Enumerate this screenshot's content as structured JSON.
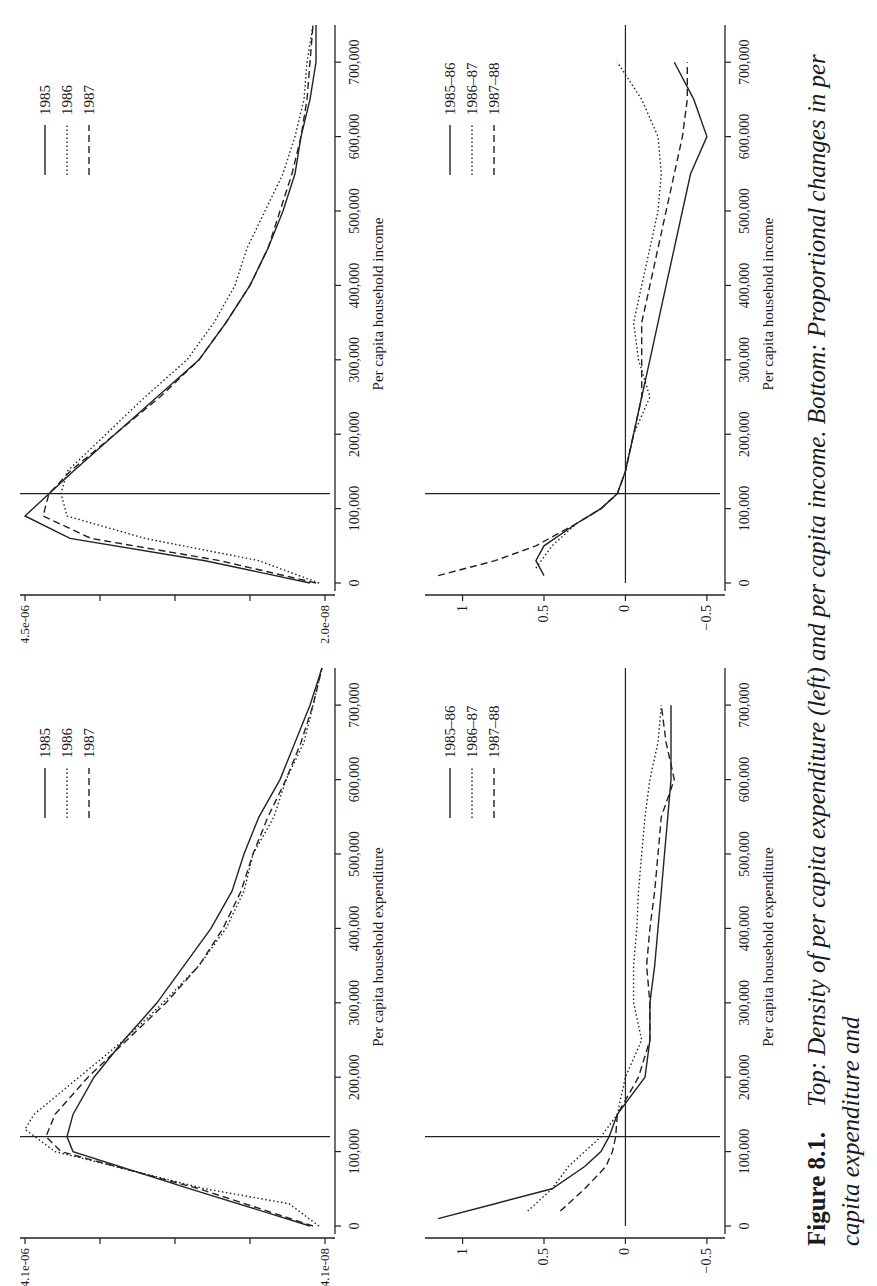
{
  "caption": {
    "figure_label": "Figure 8.1.",
    "text": "Top: Density of per capita expenditure (left) and per capita income. Bottom: Proportional changes in per capita expenditure and"
  },
  "chart_data": [
    {
      "id": "top-left",
      "type": "line",
      "title": "",
      "xlabel": "Per capita household expenditure",
      "ylabel": "",
      "x_ticks": [
        "0",
        "100,000",
        "200,000",
        "300,000",
        "400,000",
        "500,000",
        "600,000",
        "700,000"
      ],
      "y_tick_labels": [
        "4.1e-08",
        "4.1e-06"
      ],
      "y_scale": "log",
      "ylim": [
        4.1e-08,
        4.1e-06
      ],
      "xlim": [
        0,
        750000
      ],
      "vertical_reference_line_x": 120000,
      "legend": [
        "1985",
        "1986",
        "1987"
      ],
      "legend_position": "upper right",
      "series": [
        {
          "name": "1985",
          "style": "solid",
          "x": [
            0,
            50000,
            100000,
            120000,
            150000,
            200000,
            250000,
            300000,
            350000,
            400000,
            450000,
            500000,
            550000,
            600000,
            650000,
            700000,
            750000
          ],
          "y_rel": [
            0.05,
            0.45,
            0.84,
            0.86,
            0.84,
            0.77,
            0.67,
            0.56,
            0.47,
            0.38,
            0.31,
            0.27,
            0.22,
            0.15,
            0.1,
            0.05,
            0.01
          ]
        },
        {
          "name": "1986",
          "style": "dotted",
          "x": [
            0,
            30000,
            50000,
            100000,
            130000,
            150000,
            200000,
            250000,
            300000,
            350000,
            400000,
            450000,
            500000,
            550000,
            600000,
            650000,
            700000,
            750000
          ],
          "y_rel": [
            0.02,
            0.12,
            0.4,
            0.9,
            1.0,
            0.97,
            0.82,
            0.67,
            0.54,
            0.42,
            0.33,
            0.27,
            0.24,
            0.17,
            0.13,
            0.07,
            0.04,
            0.01
          ]
        },
        {
          "name": "1987",
          "style": "dashed",
          "x": [
            0,
            50000,
            100000,
            120000,
            150000,
            200000,
            250000,
            300000,
            350000,
            400000,
            450000,
            500000,
            550000,
            600000,
            650000,
            700000,
            750000
          ],
          "y_rel": [
            0.04,
            0.42,
            0.88,
            0.93,
            0.9,
            0.79,
            0.66,
            0.53,
            0.42,
            0.34,
            0.28,
            0.24,
            0.19,
            0.13,
            0.08,
            0.04,
            0.01
          ]
        }
      ]
    },
    {
      "id": "top-right",
      "type": "line",
      "title": "",
      "xlabel": "Per capita household income",
      "ylabel": "",
      "x_ticks": [
        "0",
        "100,000",
        "200,000",
        "300,000",
        "400,000",
        "500,000",
        "600,000",
        "700,000"
      ],
      "y_tick_labels": [
        "2.0e-08",
        "4.5e-06"
      ],
      "y_scale": "log",
      "ylim": [
        2e-08,
        4.5e-06
      ],
      "xlim": [
        0,
        750000
      ],
      "vertical_reference_line_x": 120000,
      "legend": [
        "1985",
        "1986",
        "1987"
      ],
      "legend_position": "upper right",
      "series": [
        {
          "name": "1985",
          "style": "solid",
          "x": [
            0,
            30000,
            60000,
            90000,
            120000,
            150000,
            200000,
            250000,
            300000,
            350000,
            400000,
            450000,
            500000,
            550000,
            600000,
            650000,
            700000,
            750000
          ],
          "y_rel": [
            0.05,
            0.4,
            0.85,
            1.0,
            0.92,
            0.84,
            0.7,
            0.56,
            0.42,
            0.33,
            0.25,
            0.19,
            0.14,
            0.1,
            0.08,
            0.05,
            0.03,
            0.03
          ]
        },
        {
          "name": "1986",
          "style": "dotted",
          "x": [
            0,
            30000,
            60000,
            90000,
            120000,
            150000,
            200000,
            250000,
            300000,
            350000,
            400000,
            450000,
            500000,
            550000,
            600000,
            650000,
            700000,
            750000
          ],
          "y_rel": [
            0.02,
            0.22,
            0.6,
            0.86,
            0.88,
            0.86,
            0.73,
            0.6,
            0.46,
            0.37,
            0.3,
            0.26,
            0.2,
            0.14,
            0.1,
            0.07,
            0.06,
            0.04
          ]
        },
        {
          "name": "1987",
          "style": "dashed",
          "x": [
            0,
            30000,
            60000,
            90000,
            120000,
            150000,
            200000,
            250000,
            300000,
            350000,
            400000,
            450000,
            500000,
            550000,
            600000,
            650000,
            700000,
            750000
          ],
          "y_rel": [
            0.03,
            0.35,
            0.78,
            0.94,
            0.92,
            0.85,
            0.7,
            0.55,
            0.42,
            0.33,
            0.25,
            0.19,
            0.15,
            0.11,
            0.08,
            0.06,
            0.05,
            0.04
          ]
        }
      ]
    },
    {
      "id": "bottom-left",
      "type": "line",
      "title": "",
      "xlabel": "Per capita household expenditure",
      "ylabel": "",
      "x_ticks": [
        "0",
        "100,000",
        "200,000",
        "300,000",
        "400,000",
        "500,000",
        "600,000",
        "700,000"
      ],
      "y_ticks": [
        -0.5,
        0,
        0.5,
        1
      ],
      "ylim": [
        -0.55,
        1.2
      ],
      "xlim": [
        0,
        750000
      ],
      "vertical_reference_line_x": 120000,
      "horizontal_reference_line_y": 0,
      "legend": [
        "1985–86",
        "1986–87",
        "1987–88"
      ],
      "legend_position": "upper right",
      "series": [
        {
          "name": "1985–86",
          "style": "solid",
          "x": [
            10000,
            30000,
            50000,
            80000,
            100000,
            120000,
            150000,
            200000,
            250000,
            300000,
            350000,
            400000,
            450000,
            500000,
            550000,
            600000,
            650000,
            700000
          ],
          "y": [
            1.15,
            0.8,
            0.45,
            0.25,
            0.15,
            0.1,
            0.05,
            -0.12,
            -0.15,
            -0.15,
            -0.18,
            -0.2,
            -0.22,
            -0.24,
            -0.26,
            -0.28,
            -0.28,
            -0.28
          ]
        },
        {
          "name": "1986–87",
          "style": "dotted",
          "x": [
            20000,
            50000,
            80000,
            100000,
            120000,
            150000,
            200000,
            250000,
            300000,
            350000,
            400000,
            450000,
            500000,
            550000,
            600000,
            650000,
            700000
          ],
          "y": [
            0.6,
            0.45,
            0.35,
            0.25,
            0.15,
            0.05,
            0.0,
            -0.1,
            -0.05,
            -0.05,
            -0.07,
            -0.08,
            -0.1,
            -0.12,
            -0.15,
            -0.2,
            -0.22
          ]
        },
        {
          "name": "1987–88",
          "style": "dashed",
          "x": [
            20000,
            50000,
            80000,
            100000,
            120000,
            150000,
            200000,
            250000,
            300000,
            350000,
            400000,
            450000,
            500000,
            550000,
            600000,
            650000,
            700000
          ],
          "y": [
            0.4,
            0.25,
            0.12,
            0.08,
            0.06,
            0.05,
            -0.08,
            -0.15,
            -0.15,
            -0.13,
            -0.15,
            -0.18,
            -0.2,
            -0.22,
            -0.3,
            -0.25,
            -0.22
          ]
        }
      ]
    },
    {
      "id": "bottom-right",
      "type": "line",
      "title": "",
      "xlabel": "Per capita household income",
      "ylabel": "",
      "x_ticks": [
        "0",
        "100,000",
        "200,000",
        "300,000",
        "400,000",
        "500,000",
        "600,000",
        "700,000"
      ],
      "y_ticks": [
        -0.5,
        0,
        0.5,
        1
      ],
      "ylim": [
        -0.55,
        1.2
      ],
      "xlim": [
        0,
        750000
      ],
      "vertical_reference_line_x": 120000,
      "horizontal_reference_line_y": 0,
      "legend": [
        "1985–86",
        "1986–87",
        "1987–88"
      ],
      "legend_position": "upper right",
      "series": [
        {
          "name": "1985–86",
          "style": "solid",
          "x": [
            10000,
            30000,
            50000,
            80000,
            100000,
            120000,
            150000,
            200000,
            250000,
            300000,
            350000,
            400000,
            450000,
            500000,
            550000,
            600000,
            650000,
            700000
          ],
          "y": [
            0.5,
            0.55,
            0.5,
            0.3,
            0.15,
            0.05,
            0.0,
            -0.05,
            -0.1,
            -0.15,
            -0.2,
            -0.25,
            -0.3,
            -0.35,
            -0.4,
            -0.5,
            -0.42,
            -0.3
          ]
        },
        {
          "name": "1986–87",
          "style": "dotted",
          "x": [
            20000,
            50000,
            80000,
            100000,
            120000,
            150000,
            200000,
            250000,
            300000,
            350000,
            400000,
            450000,
            500000,
            550000,
            600000,
            650000,
            700000
          ],
          "y": [
            0.55,
            0.45,
            0.3,
            0.15,
            0.05,
            0.0,
            -0.05,
            -0.15,
            -0.08,
            -0.05,
            -0.1,
            -0.15,
            -0.2,
            -0.22,
            -0.2,
            -0.1,
            0.05
          ]
        },
        {
          "name": "1987–88",
          "style": "dashed",
          "x": [
            10000,
            30000,
            50000,
            80000,
            100000,
            120000,
            150000,
            200000,
            250000,
            300000,
            350000,
            400000,
            450000,
            500000,
            550000,
            600000,
            650000,
            700000
          ],
          "y": [
            1.15,
            0.8,
            0.55,
            0.3,
            0.15,
            0.05,
            0.0,
            -0.05,
            -0.1,
            -0.1,
            -0.1,
            -0.15,
            -0.2,
            -0.25,
            -0.3,
            -0.35,
            -0.38,
            -0.38
          ]
        }
      ]
    }
  ]
}
